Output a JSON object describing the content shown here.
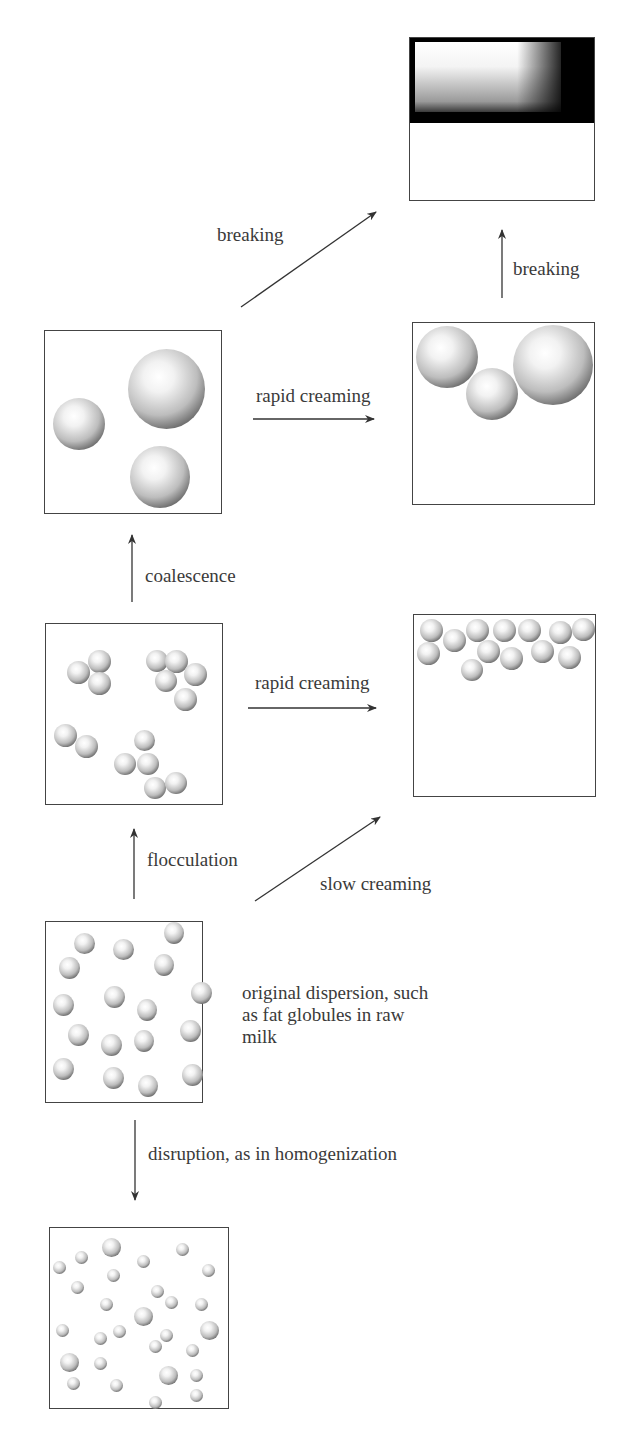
{
  "diagram": {
    "stages": {
      "broken": {
        "label": "separated oil layer over aqueous phase"
      },
      "coalesced": {
        "label": "coalesced droplets"
      },
      "creamed_large": {
        "label": "large droplets creamed"
      },
      "flocculated": {
        "label": "flocculated droplets"
      },
      "creamed_small": {
        "label": "small droplets creamed"
      },
      "original": {
        "label": "original dispersion, such as fat globules in raw milk"
      },
      "homogenized": {
        "label": "homogenized dispersion"
      }
    },
    "arrows": {
      "breaking_diagonal": "breaking",
      "breaking_vertical": "breaking",
      "rapid_creaming_top": "rapid creaming",
      "coalescence": "coalescence",
      "rapid_creaming_mid": "rapid creaming",
      "flocculation": "flocculation",
      "slow_creaming": "slow creaming",
      "disruption": "disruption, as in homogenization"
    },
    "original_caption": "original dispersion, such as fat globules in raw milk"
  }
}
